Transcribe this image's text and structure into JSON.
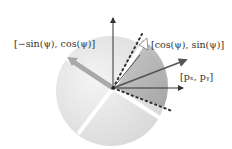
{
  "figure": {
    "type": "rotation-direction-diagram",
    "labels": {
      "perp_vector": "[−sin(ψ), cos(ψ)]",
      "dir_vector": "[cos(ψ), sin(ψ)]",
      "point_vector": "[pₓ, pᵧ]"
    },
    "colors": {
      "disc_light": "#e6e6e6",
      "sector_dark": "#b5b5b5",
      "axis": "#333333",
      "p_arrow": "#555555",
      "perp_arrow": "#a8a8a8",
      "white_bar": "#ffffff",
      "dots": "#333333"
    }
  }
}
